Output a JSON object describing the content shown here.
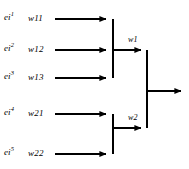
{
  "figure": {
    "kind": "block-diagram",
    "background_color": "#ffffff",
    "stroke_color": "#000000",
    "width": 189,
    "height": 169
  },
  "inputs": [
    {
      "signal": "ei",
      "superscript": "1",
      "weight": "w11",
      "row_y": 19
    },
    {
      "signal": "ei",
      "superscript": "2",
      "weight": "w12",
      "row_y": 50
    },
    {
      "signal": "ei",
      "superscript": "3",
      "weight": "w13",
      "row_y": 78
    },
    {
      "signal": "ei",
      "superscript": "4",
      "weight": "w21",
      "row_y": 114
    },
    {
      "signal": "ei",
      "superscript": "5",
      "weight": "w22",
      "row_y": 154
    }
  ],
  "nodes": {
    "first_stage": {
      "label": "w1"
    },
    "second_stage": {
      "label": "w2"
    }
  },
  "output": {
    "label": ""
  }
}
